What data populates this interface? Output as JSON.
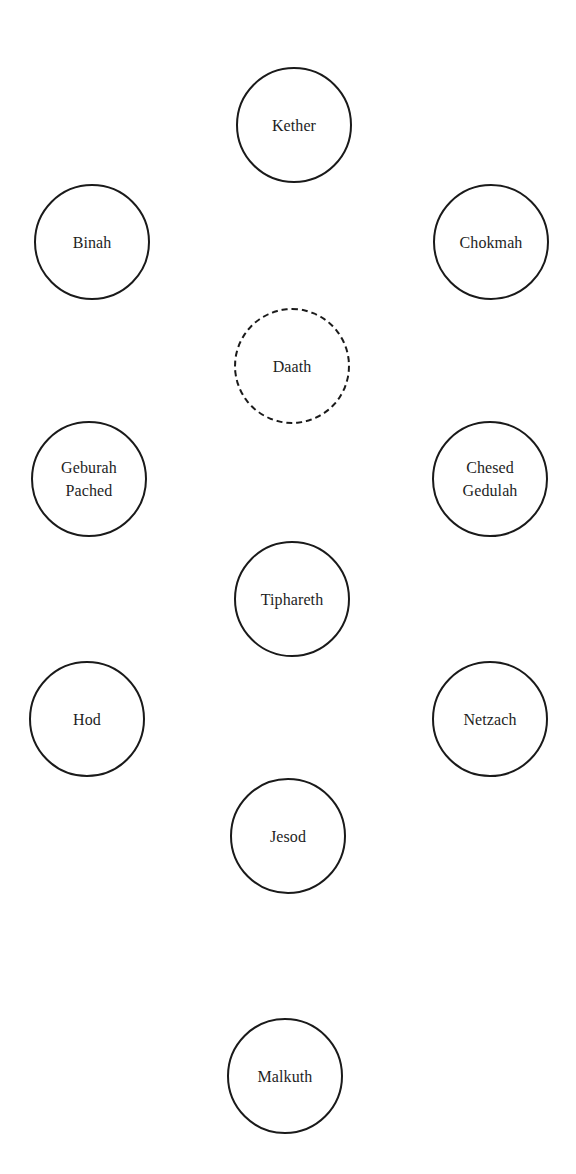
{
  "diagram": {
    "title": "",
    "nodes": [
      {
        "id": "kether",
        "lines": [
          "Kether"
        ],
        "cx": 294,
        "cy": 125,
        "style": "solid"
      },
      {
        "id": "binah",
        "lines": [
          "Binah"
        ],
        "cx": 92,
        "cy": 242,
        "style": "solid"
      },
      {
        "id": "chokmah",
        "lines": [
          "Chokmah"
        ],
        "cx": 491,
        "cy": 242,
        "style": "solid"
      },
      {
        "id": "daath",
        "lines": [
          "Daath"
        ],
        "cx": 292,
        "cy": 366,
        "style": "dashed"
      },
      {
        "id": "geburah",
        "lines": [
          "Geburah",
          "Pached"
        ],
        "cx": 89,
        "cy": 479,
        "style": "solid"
      },
      {
        "id": "chesed",
        "lines": [
          "Chesed",
          "Gedulah"
        ],
        "cx": 490,
        "cy": 479,
        "style": "solid"
      },
      {
        "id": "tiphareth",
        "lines": [
          "Tiphareth"
        ],
        "cx": 292,
        "cy": 599,
        "style": "solid"
      },
      {
        "id": "hod",
        "lines": [
          "Hod"
        ],
        "cx": 87,
        "cy": 719,
        "style": "solid"
      },
      {
        "id": "netzach",
        "lines": [
          "Netzach"
        ],
        "cx": 490,
        "cy": 719,
        "style": "solid"
      },
      {
        "id": "jesod",
        "lines": [
          "Jesod"
        ],
        "cx": 288,
        "cy": 836,
        "style": "solid"
      },
      {
        "id": "malkuth",
        "lines": [
          "Malkuth"
        ],
        "cx": 285,
        "cy": 1076,
        "style": "solid"
      }
    ]
  },
  "colors": {
    "background": "#ffffff",
    "stroke": "#1a1a1a",
    "text": "#1e1e1e"
  }
}
